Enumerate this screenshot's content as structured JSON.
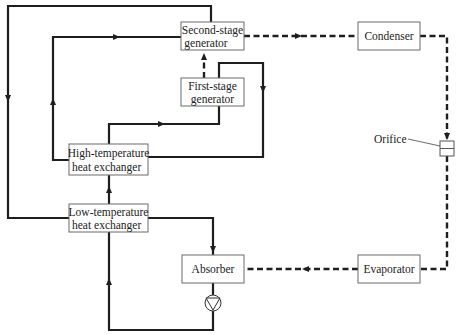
{
  "diagram": {
    "components": {
      "second_stage_generator": {
        "line1": "Second-stage",
        "line2": "generator"
      },
      "first_stage_generator": {
        "line1": "First-stage",
        "line2": "generator"
      },
      "high_temp_hx": {
        "line1": "High-temperature",
        "line2": "heat exchanger"
      },
      "low_temp_hx": {
        "line1": "Low-temperature",
        "line2": "heat exchanger"
      },
      "absorber": {
        "label": "Absorber"
      },
      "condenser": {
        "label": "Condenser"
      },
      "evaporator": {
        "label": "Evaporator"
      },
      "orifice": {
        "label": "Orifice"
      },
      "pump": {
        "label": ""
      }
    },
    "line_styles": {
      "solution_flow": "solid",
      "refrigerant_flow": "dashed"
    },
    "colors": {
      "line": "#1e1e1e",
      "box_border": "#6a6a6a",
      "background": "#ffffff"
    }
  }
}
